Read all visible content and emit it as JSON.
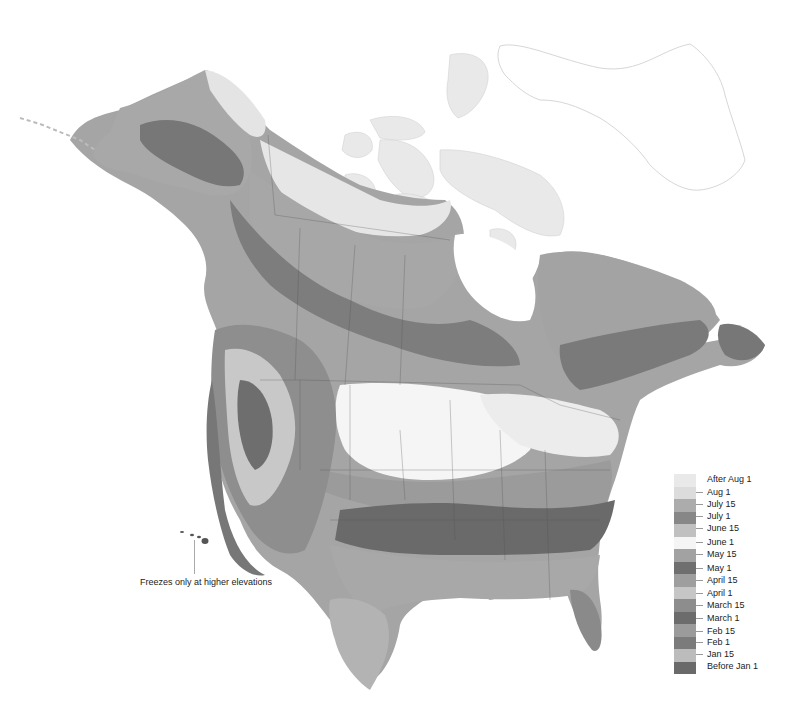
{
  "map": {
    "title": "",
    "region": "North America",
    "subject": "Average date of last spring frost",
    "annotation": "Freezes only at higher elevations",
    "colors": {
      "after_aug_1": "#e9e9e9",
      "aug_1": "#dedede",
      "july_15": "#b4b4b4",
      "july_1": "#8a8a8a",
      "june_15": "#bfbfbf",
      "june_1": "#f7f7f7",
      "may_15": "#a5a5a5",
      "may_1": "#6e6e6e",
      "april_15": "#a0a0a0",
      "april_1": "#c4c4c4",
      "march_15": "#8c8c8c",
      "march_1": "#6a6a6a",
      "feb_15": "#9a9a9a",
      "feb_1": "#7a7a7a",
      "jan_15": "#bdbdbd",
      "before_jan_1": "#6b6b6b",
      "water": "#ffffff",
      "border": "#555555"
    }
  },
  "legend": {
    "items": [
      {
        "label": "After Aug 1",
        "color": "#e9e9e9"
      },
      {
        "label": "Aug 1",
        "color": "#dcdcdc"
      },
      {
        "label": "July 15",
        "color": "#acacac"
      },
      {
        "label": "July 1",
        "color": "#878787"
      },
      {
        "label": "June 15",
        "color": "#c0c0c0"
      },
      {
        "label": "June 1",
        "color": "#f5f5f5"
      },
      {
        "label": "May 15",
        "color": "#a2a2a2"
      },
      {
        "label": "May 1",
        "color": "#6f6f6f"
      },
      {
        "label": "April 15",
        "color": "#9e9e9e"
      },
      {
        "label": "April 1",
        "color": "#c6c6c6"
      },
      {
        "label": "March 15",
        "color": "#8d8d8d"
      },
      {
        "label": "March 1",
        "color": "#6c6c6c"
      },
      {
        "label": "Feb 15",
        "color": "#9b9b9b"
      },
      {
        "label": "Feb 1",
        "color": "#7b7b7b"
      },
      {
        "label": "Jan 15",
        "color": "#bcbcbc"
      },
      {
        "label": "Before Jan 1",
        "color": "#6a6a6a"
      }
    ]
  }
}
